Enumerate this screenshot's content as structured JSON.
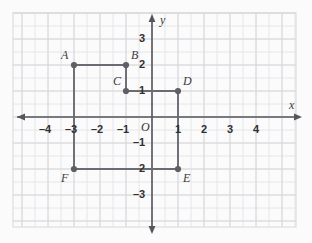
{
  "figure": {
    "kind": "coordinate-grid",
    "background": "#fbfbfb",
    "grid_color": "#d8d8dc",
    "minor_grid_color": "#e6e6ea",
    "axis_color": "#55555c",
    "shape_color": "#6b6b73",
    "point_color": "#5f5f67"
  },
  "axes": {
    "x_label": "x",
    "y_label": "y",
    "origin_label": "O",
    "x_ticks": [
      {
        "value": -4,
        "label": "–4"
      },
      {
        "value": -3,
        "label": "–3"
      },
      {
        "value": -2,
        "label": "–2"
      },
      {
        "value": -1,
        "label": "–1"
      },
      {
        "value": 1,
        "label": "1"
      },
      {
        "value": 2,
        "label": "2"
      },
      {
        "value": 3,
        "label": "3"
      },
      {
        "value": 4,
        "label": "4"
      }
    ],
    "y_ticks": [
      {
        "value": 3,
        "label": "3"
      },
      {
        "value": 2,
        "label": "2"
      },
      {
        "value": 1,
        "label": "1"
      },
      {
        "value": -1,
        "label": "–1"
      },
      {
        "value": -2,
        "label": "2"
      },
      {
        "value": -3,
        "label": "–3"
      }
    ],
    "xlim": [
      -5.35,
      6.15
    ],
    "ylim": [
      -4.0,
      4.0
    ]
  },
  "chart_data": {
    "type": "scatter",
    "title": "",
    "xlabel": "x",
    "ylabel": "y",
    "xlim": [
      -5.35,
      6.15
    ],
    "ylim": [
      -4.0,
      4.0
    ],
    "grid": true,
    "legend": "none",
    "points": [
      {
        "name": "A",
        "x": -3,
        "y": 2,
        "label_pos": "above-left"
      },
      {
        "name": "B",
        "x": -1,
        "y": 2,
        "label_pos": "above-right"
      },
      {
        "name": "C",
        "x": -1,
        "y": 1,
        "label_pos": "above-left"
      },
      {
        "name": "D",
        "x": 1,
        "y": 1,
        "label_pos": "above-right"
      },
      {
        "name": "E",
        "x": 1,
        "y": -2,
        "label_pos": "below-right"
      },
      {
        "name": "F",
        "x": -3,
        "y": -2,
        "label_pos": "below-left"
      }
    ],
    "polygon": {
      "closed": true,
      "vertex_order": [
        "A",
        "B",
        "C",
        "D",
        "E",
        "F"
      ]
    }
  }
}
